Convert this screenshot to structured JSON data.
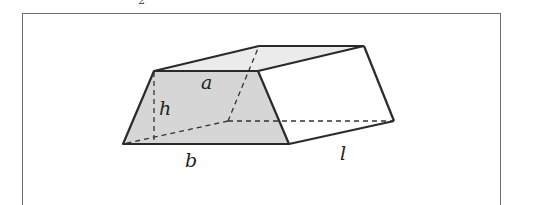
{
  "header_fragment": {
    "left": "2",
    "right": ""
  },
  "diagram": {
    "labels": {
      "top_width": "a",
      "height": "h",
      "bottom_width": "b",
      "length": "l"
    },
    "colors": {
      "front_face": "#d6d6d6",
      "top_face": "#ebebeb",
      "side_face": "#ffffff",
      "edge": "#2a2a2a",
      "frame": "#6e6e6e"
    }
  }
}
